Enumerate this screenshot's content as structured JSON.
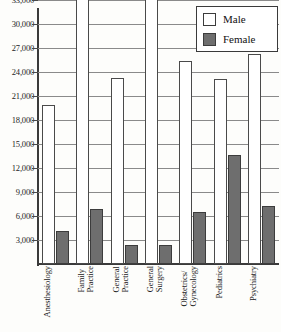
{
  "chart_data": {
    "type": "bar",
    "title": "",
    "subtitle": "",
    "xlabel": "",
    "ylabel": "",
    "ylim": [
      0,
      37500
    ],
    "ytick_step": 3000,
    "grid": true,
    "legend_position": "top-right",
    "categories": [
      "Anesthesiology",
      "Family\nPractice",
      "General\nPractice",
      "General\nSurgery",
      "Obstetrics/\nGynecology",
      "Pediatrics",
      "Psychiatry"
    ],
    "ytick_labels": [
      "3,000",
      "6,000",
      "9,000",
      "12,000",
      "15,000",
      "18,000",
      "21,000",
      "24,000",
      "27,000",
      "30,000",
      "33,000",
      "36,000"
    ],
    "series": [
      {
        "name": "Male",
        "color": "#ffffff",
        "values": [
          19900,
          36400,
          23300,
          35400,
          25400,
          23100,
          26300
        ]
      },
      {
        "name": "Female",
        "color": "#6e6e6e",
        "values": [
          4100,
          6900,
          2400,
          2400,
          6500,
          13600,
          7200
        ]
      }
    ]
  },
  "legend": {
    "items": [
      {
        "label": "Male",
        "swatch": "white-square-icon"
      },
      {
        "label": "Female",
        "swatch": "gray-square-icon"
      }
    ]
  }
}
